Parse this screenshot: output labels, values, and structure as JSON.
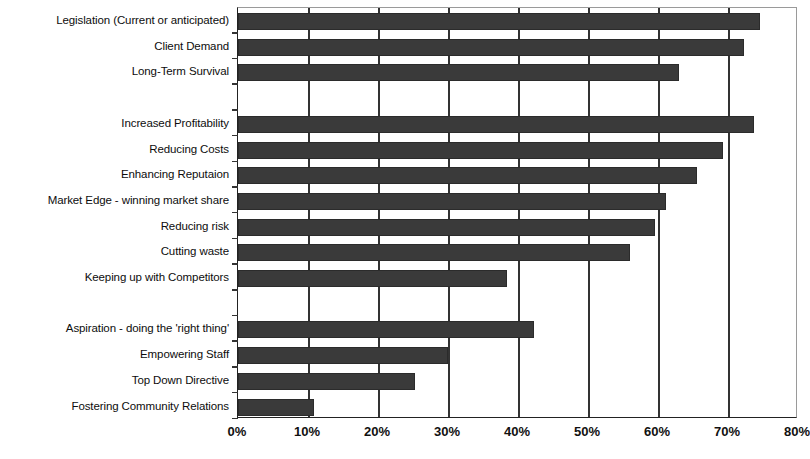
{
  "chart_data": {
    "type": "bar",
    "orientation": "horizontal",
    "title": "",
    "subtitle": "",
    "xlabel": "",
    "ylabel": "",
    "xlim": [
      0,
      80
    ],
    "xtick_labels": [
      "0%",
      "10%",
      "20%",
      "30%",
      "40%",
      "50%",
      "60%",
      "70%",
      "80%"
    ],
    "xticks": [
      0,
      10,
      20,
      30,
      40,
      50,
      60,
      70,
      80
    ],
    "xtick_suffix": "%",
    "grid": true,
    "grid_axis": "x",
    "legend": false,
    "bar_color": "#3a3a3a",
    "categories": [
      "Legislation (Current or anticipated)",
      "Client Demand",
      "Long-Term Survival",
      "Increased Profitability",
      "Reducing Costs",
      "Enhancing Reputaion",
      "Market Edge - winning market share",
      "Reducing risk",
      "Cutting waste",
      "Keeping up with Competitors",
      "Aspiration - doing the 'right thing'",
      "Empowering Staff",
      "Top Down Directive",
      "Fostering Community Relations"
    ],
    "values": [
      74.5,
      72.3,
      63,
      73.7,
      69.3,
      65.6,
      61.1,
      59.6,
      56,
      38.4,
      42.3,
      30,
      25.3,
      10.8
    ],
    "groups": [
      {
        "name": "group-1",
        "items": [
          {
            "label": "Legislation (Current or anticipated)",
            "value": 74.5,
            "slot": 0
          },
          {
            "label": "Client Demand",
            "value": 72.3,
            "slot": 1
          },
          {
            "label": "Long-Term Survival",
            "value": 63,
            "slot": 2
          }
        ]
      },
      {
        "name": "group-2",
        "items": [
          {
            "label": "Increased Profitability",
            "value": 73.7,
            "slot": 4
          },
          {
            "label": "Reducing Costs",
            "value": 69.3,
            "slot": 5
          },
          {
            "label": "Enhancing Reputaion",
            "value": 65.6,
            "slot": 6
          },
          {
            "label": "Market Edge - winning market share",
            "value": 61.1,
            "slot": 7
          },
          {
            "label": "Reducing risk",
            "value": 59.6,
            "slot": 8
          },
          {
            "label": "Cutting waste",
            "value": 56,
            "slot": 9
          },
          {
            "label": "Keeping up with Competitors",
            "value": 38.4,
            "slot": 10
          }
        ]
      },
      {
        "name": "group-3",
        "items": [
          {
            "label": "Aspiration - doing the 'right thing'",
            "value": 42.3,
            "slot": 12
          },
          {
            "label": "Empowering Staff",
            "value": 30,
            "slot": 13
          },
          {
            "label": "Top Down Directive",
            "value": 25.3,
            "slot": 14
          },
          {
            "label": "Fostering Community Relations",
            "value": 10.8,
            "slot": 15
          }
        ]
      }
    ],
    "empty_slots": [
      3,
      11
    ],
    "total_slots": 16
  }
}
